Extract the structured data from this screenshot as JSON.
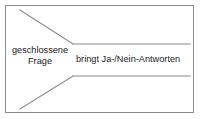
{
  "diagram": {
    "frame": {
      "border_color": "#8c8c8c",
      "background_color": "#ffffff"
    },
    "line_color": "#8c8c8c",
    "labels": {
      "left": "geschlossene\nFrage",
      "right": "bringt Ja-/Nein-Antworten"
    },
    "text_color": "#1a1a1a",
    "funnel": {
      "top_diagonal": "M20,10 L73,44",
      "top_horizontal": "M73,44 L190,44",
      "bottom_diagonal": "M20,109 L73,76",
      "bottom_horizontal": "M73,76 L190,76"
    }
  }
}
